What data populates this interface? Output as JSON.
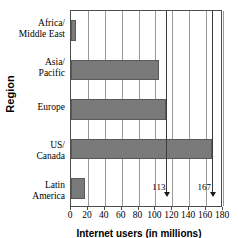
{
  "chart_data": {
    "type": "bar",
    "orientation": "horizontal",
    "title": "",
    "xlabel": "Internet users (in millions)",
    "ylabel": "Region",
    "categories": [
      "Latin America",
      "US/ Canada",
      "Europe",
      "Asia/ Pacific",
      "Africa/ Middle East"
    ],
    "values": [
      16,
      167,
      113,
      104,
      6
    ],
    "xlim": [
      0,
      180
    ],
    "xticks": [
      0,
      20,
      40,
      60,
      80,
      100,
      120,
      140,
      160,
      180
    ],
    "grid": true,
    "legend": false,
    "bar_color": "#7a7a7a",
    "annotations": [
      {
        "label": "113",
        "value": 113
      },
      {
        "label": "167",
        "value": 167
      }
    ]
  },
  "axes": {
    "y_title": "Region",
    "x_title": "Internet users (in millions)",
    "x_tick_labels": [
      "0",
      "20",
      "40",
      "60",
      "80",
      "100",
      "120",
      "140",
      "160",
      "180"
    ],
    "category_labels": [
      {
        "line1": "Africa/",
        "line2": "Middle East"
      },
      {
        "line1": "Asia/",
        "line2": "Pacific"
      },
      {
        "line1": "Europe",
        "line2": ""
      },
      {
        "line1": "US/",
        "line2": "Canada"
      },
      {
        "line1": "Latin",
        "line2": "America"
      }
    ]
  },
  "callouts": {
    "first": "113",
    "second": "167"
  },
  "colors": {
    "bar_fill": "#7a7a7a",
    "bar_edge": "#5a5a5a",
    "gridline": "#9a9a9a",
    "frame": "#4d4d4d",
    "text": "#000000"
  }
}
